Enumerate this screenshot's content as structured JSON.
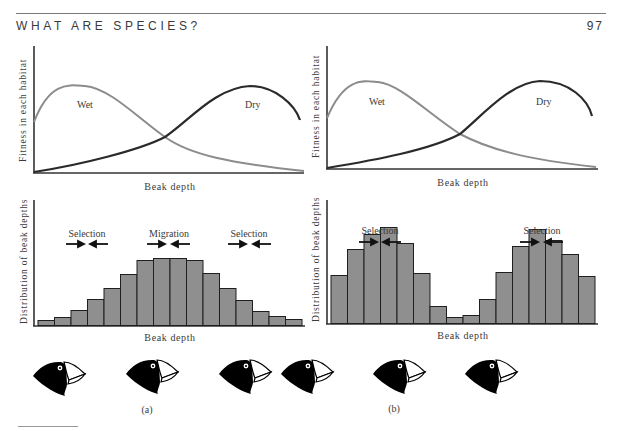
{
  "header": {
    "running_head": "WHAT ARE SPECIES?",
    "page_number": "97"
  },
  "panels": [
    {
      "caption": "(a)",
      "fitness_chart": {
        "ylabel": "Fitness in each habitat",
        "xlabel": "Beak depth",
        "curves": [
          {
            "name": "Wet",
            "color": "#8c8c8c"
          },
          {
            "name": "Dry",
            "color": "#2a2a2a"
          }
        ]
      },
      "distribution_chart": {
        "ylabel": "Distribution of beak depths",
        "xlabel": "Beak depth",
        "annotations": [
          "Selection",
          "Migration",
          "Selection"
        ]
      }
    },
    {
      "caption": "(b)",
      "fitness_chart": {
        "ylabel": "Fitness in each habitat",
        "xlabel": "Beak depth",
        "curves": [
          {
            "name": "Wet",
            "color": "#8c8c8c"
          },
          {
            "name": "Dry",
            "color": "#2a2a2a"
          }
        ]
      },
      "distribution_chart": {
        "ylabel": "Distribution of beak depths",
        "xlabel": "Beak depth",
        "annotations": [
          "Selection",
          "Selection"
        ]
      }
    }
  ],
  "chart_data": [
    {
      "type": "line",
      "title": "(a) Fitness",
      "xlabel": "Beak depth",
      "ylabel": "Fitness in each habitat",
      "series": [
        {
          "name": "Wet",
          "description": "peaks at low beak depth, declines"
        },
        {
          "name": "Dry",
          "description": "rises, peaks at high beak depth"
        }
      ]
    },
    {
      "type": "bar",
      "title": "(a) Distribution",
      "xlabel": "Beak depth",
      "ylabel": "Distribution of beak depths",
      "categories": [
        1,
        2,
        3,
        4,
        5,
        6,
        7,
        8,
        9,
        10,
        11,
        12,
        13,
        14,
        15,
        16
      ],
      "values": [
        5,
        8,
        15,
        26,
        37,
        51,
        65,
        67,
        67,
        65,
        52,
        37,
        25,
        14,
        9,
        6
      ]
    },
    {
      "type": "line",
      "title": "(b) Fitness",
      "xlabel": "Beak depth",
      "ylabel": "Fitness in each habitat",
      "series": [
        {
          "name": "Wet"
        },
        {
          "name": "Dry"
        }
      ]
    },
    {
      "type": "bar",
      "title": "(b) Distribution",
      "xlabel": "Beak depth",
      "ylabel": "Distribution of beak depths",
      "categories": [
        1,
        2,
        3,
        4,
        5,
        6,
        7,
        8,
        9,
        10,
        11,
        12,
        13,
        14,
        15,
        16
      ],
      "values": [
        48,
        74,
        89,
        96,
        80,
        50,
        17,
        6,
        8,
        24,
        51,
        77,
        94,
        83,
        69,
        47
      ]
    }
  ],
  "colors": {
    "bar_fill": "#8f8f8f",
    "bar_stroke": "#1f1f1f",
    "axis": "#333333"
  }
}
